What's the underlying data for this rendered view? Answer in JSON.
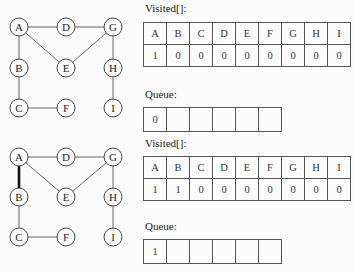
{
  "steps": [
    {
      "graph": {
        "nodes": [
          {
            "id": "A",
            "x": 19,
            "y": 27
          },
          {
            "id": "D",
            "x": 66,
            "y": 27
          },
          {
            "id": "G",
            "x": 113,
            "y": 27
          },
          {
            "id": "B",
            "x": 19,
            "y": 68
          },
          {
            "id": "E",
            "x": 66,
            "y": 68
          },
          {
            "id": "H",
            "x": 113,
            "y": 68
          },
          {
            "id": "C",
            "x": 19,
            "y": 108
          },
          {
            "id": "F",
            "x": 66,
            "y": 108
          },
          {
            "id": "I",
            "x": 113,
            "y": 108
          }
        ],
        "edges": [
          [
            "A",
            "D"
          ],
          [
            "D",
            "G"
          ],
          [
            "A",
            "B"
          ],
          [
            "A",
            "E"
          ],
          [
            "E",
            "G"
          ],
          [
            "G",
            "H"
          ],
          [
            "H",
            "I"
          ],
          [
            "B",
            "C"
          ],
          [
            "C",
            "F"
          ]
        ],
        "highlighted_edges": []
      },
      "visited_label": "Visited[]:",
      "visited_headers": [
        "A",
        "B",
        "C",
        "D",
        "E",
        "F",
        "G",
        "H",
        "I"
      ],
      "visited_values": [
        "1",
        "0",
        "0",
        "0",
        "0",
        "0",
        "0",
        "0",
        "0"
      ],
      "queue_label": "Queue:",
      "queue": [
        "0",
        "",
        "",
        "",
        "",
        ""
      ]
    },
    {
      "graph": {
        "nodes": [
          {
            "id": "A",
            "x": 19,
            "y": 157
          },
          {
            "id": "D",
            "x": 66,
            "y": 157
          },
          {
            "id": "G",
            "x": 113,
            "y": 157
          },
          {
            "id": "B",
            "x": 19,
            "y": 197
          },
          {
            "id": "E",
            "x": 66,
            "y": 197
          },
          {
            "id": "H",
            "x": 113,
            "y": 197
          },
          {
            "id": "C",
            "x": 19,
            "y": 237
          },
          {
            "id": "F",
            "x": 66,
            "y": 237
          },
          {
            "id": "I",
            "x": 113,
            "y": 237
          }
        ],
        "edges": [
          [
            "A",
            "D"
          ],
          [
            "D",
            "G"
          ],
          [
            "A",
            "B"
          ],
          [
            "A",
            "E"
          ],
          [
            "E",
            "G"
          ],
          [
            "G",
            "H"
          ],
          [
            "H",
            "I"
          ],
          [
            "B",
            "C"
          ],
          [
            "C",
            "F"
          ]
        ],
        "highlighted_edges": [
          [
            "A",
            "B"
          ]
        ]
      },
      "visited_label": "Visited[]:",
      "visited_headers": [
        "A",
        "B",
        "C",
        "D",
        "E",
        "F",
        "G",
        "H",
        "I"
      ],
      "visited_values": [
        "1",
        "1",
        "0",
        "0",
        "0",
        "0",
        "0",
        "0",
        "0"
      ],
      "queue_label": "Queue:",
      "queue": [
        "1",
        "",
        "",
        "",
        "",
        ""
      ]
    }
  ],
  "colors": {
    "edge": "#666666",
    "highlight_edge": "#111111",
    "node_stroke": "#444444",
    "node_fill": "#ffffff"
  }
}
